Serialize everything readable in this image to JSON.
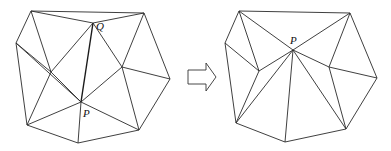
{
  "figure": {
    "labels": {
      "left_q": "Q",
      "left_p": "P",
      "right_p": "P"
    },
    "arrow": "right-hollow-arrow",
    "left": {
      "vertices": {
        "A": [
          31,
          11
        ],
        "B": [
          144,
          13
        ],
        "Q": [
          93,
          23
        ],
        "C": [
          16,
          43
        ],
        "D": [
          51,
          72
        ],
        "E": [
          122,
          67
        ],
        "F": [
          170,
          79
        ],
        "P": [
          81,
          102
        ],
        "G": [
          27,
          125
        ],
        "H": [
          139,
          130
        ],
        "I": [
          78,
          143
        ]
      },
      "edges": [
        [
          "A",
          "B"
        ],
        [
          "A",
          "Q"
        ],
        [
          "A",
          "C"
        ],
        [
          "A",
          "D"
        ],
        [
          "Q",
          "B"
        ],
        [
          "Q",
          "P"
        ],
        [
          "Q",
          "D"
        ],
        [
          "Q",
          "E"
        ],
        [
          "B",
          "E"
        ],
        [
          "B",
          "F"
        ],
        [
          "C",
          "D"
        ],
        [
          "C",
          "P"
        ],
        [
          "C",
          "G"
        ],
        [
          "D",
          "G"
        ],
        [
          "D",
          "P"
        ],
        [
          "G",
          "P"
        ],
        [
          "G",
          "I"
        ],
        [
          "I",
          "P"
        ],
        [
          "I",
          "H"
        ],
        [
          "P",
          "H"
        ],
        [
          "P",
          "E"
        ],
        [
          "E",
          "F"
        ],
        [
          "E",
          "H"
        ],
        [
          "F",
          "H"
        ]
      ],
      "bold_edge": [
        "Q",
        "P"
      ]
    },
    "right": {
      "vertices": {
        "A": [
          239,
          11
        ],
        "B": [
          350,
          13
        ],
        "P": [
          293,
          50
        ],
        "C": [
          225,
          43
        ],
        "D": [
          259,
          71
        ],
        "E": [
          329,
          67
        ],
        "F": [
          377,
          78
        ],
        "G": [
          236,
          123
        ],
        "H": [
          346,
          129
        ],
        "I": [
          285,
          142
        ]
      },
      "edges": [
        [
          "A",
          "B"
        ],
        [
          "A",
          "C"
        ],
        [
          "A",
          "D"
        ],
        [
          "A",
          "P"
        ],
        [
          "B",
          "P"
        ],
        [
          "B",
          "E"
        ],
        [
          "B",
          "F"
        ],
        [
          "C",
          "D"
        ],
        [
          "C",
          "G"
        ],
        [
          "D",
          "P"
        ],
        [
          "D",
          "G"
        ],
        [
          "G",
          "P"
        ],
        [
          "G",
          "I"
        ],
        [
          "I",
          "P"
        ],
        [
          "I",
          "H"
        ],
        [
          "H",
          "P"
        ],
        [
          "H",
          "E"
        ],
        [
          "H",
          "F"
        ],
        [
          "E",
          "P"
        ],
        [
          "E",
          "F"
        ]
      ]
    }
  }
}
